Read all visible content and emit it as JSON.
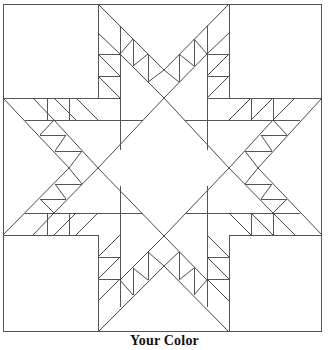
{
  "caption": "Your Color",
  "pattern": {
    "name": "feathered-star-quilt-block",
    "stroke_color": "#555555",
    "background": "#ffffff"
  }
}
